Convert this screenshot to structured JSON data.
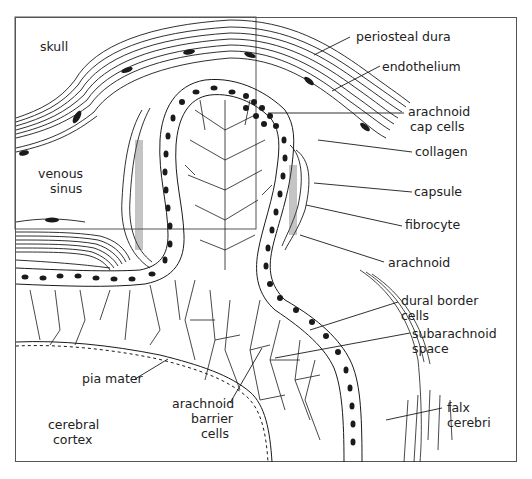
{
  "figure": {
    "type": "anatomical-diagram",
    "colors": {
      "line": "#1a1a1a",
      "background": "#ffffff",
      "frame": "#555555"
    }
  },
  "labels": {
    "skull": "skull",
    "venous_sinus_1": "venous",
    "venous_sinus_2": "sinus",
    "periosteal_dura": "periosteal dura",
    "endothelium": "endothelium",
    "arachnoid_cap_cells_1": "arachnoid",
    "arachnoid_cap_cells_2": "cap cells",
    "collagen": "collagen",
    "capsule": "capsule",
    "fibrocyte": "fibrocyte",
    "arachnoid": "arachnoid",
    "dural_border_cells_1": "dural border",
    "dural_border_cells_2": "cells",
    "subarachnoid_space_1": "subarachnoid",
    "subarachnoid_space_2": "space",
    "pia_mater": "pia mater",
    "arachnoid_barrier_cells_1": "arachnoid",
    "arachnoid_barrier_cells_2": "barrier",
    "arachnoid_barrier_cells_3": "cells",
    "cerebral_cortex_1": "cerebral",
    "cerebral_cortex_2": "cortex",
    "falx_cerebri_1": "falx",
    "falx_cerebri_2": "cerebri"
  }
}
